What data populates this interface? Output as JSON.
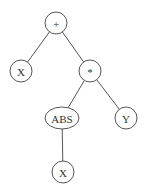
{
  "diagram": {
    "type": "expression-tree",
    "nodes": [
      {
        "id": "plus",
        "label": "+",
        "shape": "circle",
        "cx": 56,
        "cy": 23,
        "rx": 11,
        "ry": 11
      },
      {
        "id": "x1",
        "label": "X",
        "shape": "circle",
        "cx": 21,
        "cy": 71,
        "rx": 11,
        "ry": 11
      },
      {
        "id": "mul",
        "label": "*",
        "shape": "circle",
        "cx": 90,
        "cy": 71,
        "rx": 11,
        "ry": 11
      },
      {
        "id": "abs",
        "label": "ABS",
        "shape": "ellipse",
        "cx": 62,
        "cy": 118,
        "rx": 17,
        "ry": 11
      },
      {
        "id": "y",
        "label": "Y",
        "shape": "circle",
        "cx": 126,
        "cy": 118,
        "rx": 11,
        "ry": 11
      },
      {
        "id": "x2",
        "label": "X",
        "shape": "circle",
        "cx": 63,
        "cy": 172,
        "rx": 11,
        "ry": 11
      }
    ],
    "edges": [
      {
        "from": "plus",
        "to": "x1"
      },
      {
        "from": "plus",
        "to": "mul"
      },
      {
        "from": "mul",
        "to": "abs"
      },
      {
        "from": "mul",
        "to": "y"
      },
      {
        "from": "abs",
        "to": "x2"
      }
    ]
  }
}
